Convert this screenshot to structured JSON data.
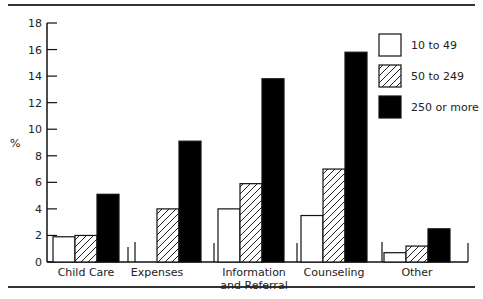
{
  "chart_data": {
    "type": "bar",
    "title": "",
    "xlabel": "",
    "ylabel": "%",
    "ylim": [
      0,
      18
    ],
    "yticks": [
      0,
      2,
      4,
      6,
      8,
      10,
      12,
      14,
      16,
      18
    ],
    "grid": false,
    "legend_position": "top-right",
    "categories": [
      "Child Care",
      "Expenses",
      "Information and Referral",
      "Counseling",
      "Other"
    ],
    "category_label_lines": [
      [
        "Child Care"
      ],
      [
        "Expenses"
      ],
      [
        "Information",
        "and Referral"
      ],
      [
        "Counseling"
      ],
      [
        "Other"
      ]
    ],
    "series": [
      {
        "name": "10 to 49",
        "pattern": "white",
        "values": [
          1.9,
          0,
          4.0,
          3.5,
          0.7
        ]
      },
      {
        "name": "50 to 249",
        "pattern": "hatched",
        "values": [
          2.0,
          4.0,
          5.9,
          7.0,
          1.2
        ]
      },
      {
        "name": "250 or more",
        "pattern": "black",
        "values": [
          5.1,
          9.1,
          13.8,
          15.8,
          2.5
        ]
      }
    ]
  }
}
